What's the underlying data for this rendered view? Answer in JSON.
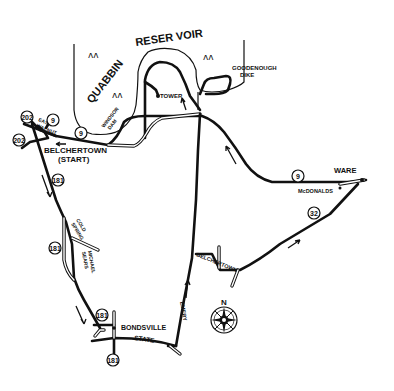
{
  "map": {
    "water_body": "QUABBIN RESERVOIR",
    "places": {
      "tower": "TOWER",
      "goodenough_dike": [
        "GOODENOUGH",
        "DIKE"
      ],
      "windsor_dam": [
        "WINDSOR",
        "DAM"
      ],
      "belchertown_start": [
        "BELCHERTOWN",
        "(START)"
      ],
      "east_walnut": [
        "EAST",
        "WALNUT"
      ],
      "ware": "WARE",
      "mcdonalds": "McDONALDS",
      "cold_spring": [
        "COLD",
        "SPRING"
      ],
      "michael_sears": [
        "MICHAEL",
        "SEARS"
      ],
      "bondsville": "BONDSVILLE",
      "state": "STATE",
      "emery": "EMERY",
      "belchertown_road": "BELCHERTOWN"
    },
    "route_shields": [
      {
        "id": "202-top",
        "label": "202"
      },
      {
        "id": "202-left",
        "label": "202"
      },
      {
        "id": "9-a",
        "label": "9"
      },
      {
        "id": "9-b",
        "label": "9"
      },
      {
        "id": "9-ware",
        "label": "9"
      },
      {
        "id": "181-a",
        "label": "181"
      },
      {
        "id": "181-b",
        "label": "181"
      },
      {
        "id": "181-c",
        "label": "181"
      },
      {
        "id": "181-d",
        "label": "181"
      },
      {
        "id": "32",
        "label": "32"
      }
    ],
    "compass": {
      "north_label": "N"
    }
  }
}
